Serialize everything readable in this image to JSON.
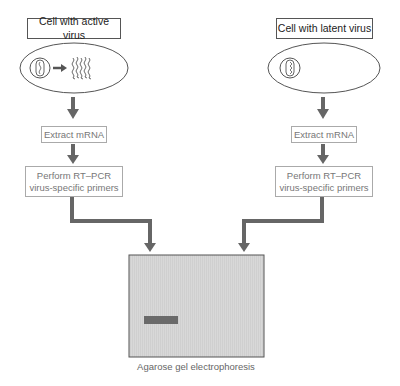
{
  "left_branch": {
    "title": "Cell with active virus",
    "state": "active",
    "steps": [
      {
        "label": "Extract mRNA"
      },
      {
        "label_line1": "Perform RT–PCR",
        "label_line2": "virus-specific primers"
      }
    ]
  },
  "right_branch": {
    "title": "Cell with latent virus",
    "state": "latent",
    "steps": [
      {
        "label": "Extract mRNA"
      },
      {
        "label_line1": "Perform RT–PCR",
        "label_line2": "virus-specific primers"
      }
    ]
  },
  "gel": {
    "caption": "Agarose gel electrophoresis",
    "bands": [
      {
        "lane": "left",
        "present": true
      }
    ],
    "colors": {
      "gel_fill": "#d6d6d6",
      "band": "#6a6a6a",
      "arrow": "#666666"
    }
  }
}
